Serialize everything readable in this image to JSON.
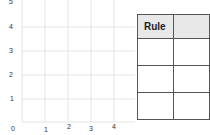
{
  "graph": {
    "x_ticks": [
      "0",
      "1",
      "2",
      "3",
      "4"
    ],
    "y_ticks": [
      "1",
      "2",
      "3",
      "4",
      "5"
    ]
  },
  "table": {
    "headers": [
      "Rule",
      ""
    ],
    "rows": [
      [
        "",
        ""
      ],
      [
        "",
        ""
      ],
      [
        "",
        ""
      ]
    ]
  }
}
